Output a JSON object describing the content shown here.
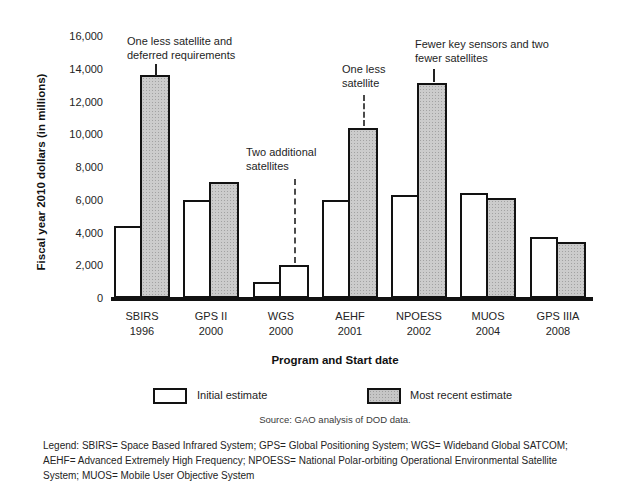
{
  "chart_data": {
    "type": "bar",
    "title": "",
    "ylabel": "Fiscal year 2010 dollars (in millions)",
    "xlabel": "Program and Start date",
    "ylim": [
      0,
      16000
    ],
    "ytick_interval": 2000,
    "ytick_labels": [
      "16,000",
      "14,000",
      "12,000",
      "10,000",
      "8,000",
      "6,000",
      "4,000",
      "2,000",
      "0"
    ],
    "grid": "off",
    "legend_position": "bottom",
    "categories": [
      {
        "program": "SBIRS",
        "start_date": "1996"
      },
      {
        "program": "GPS II",
        "start_date": "2000"
      },
      {
        "program": "WGS",
        "start_date": "2000"
      },
      {
        "program": "AEHF",
        "start_date": "2001"
      },
      {
        "program": "NPOESS",
        "start_date": "2002"
      },
      {
        "program": "MUOS",
        "start_date": "2004"
      },
      {
        "program": "GPS IIIA",
        "start_date": "2008"
      }
    ],
    "series": [
      {
        "name": "Initial estimate",
        "fill": "white",
        "values": [
          4400,
          6000,
          1000,
          6000,
          6300,
          6400,
          3700
        ]
      },
      {
        "name": "Most recent estimate",
        "fill": "gray-halftone",
        "fill_exceptions": [
          2
        ],
        "values": [
          13600,
          7100,
          2000,
          10400,
          13100,
          6100,
          3400
        ]
      }
    ],
    "annotations": [
      {
        "lines": [
          "One less satellite and",
          "deferred requirements"
        ],
        "target_category": "SBIRS",
        "leader": "solid"
      },
      {
        "lines": [
          "Two additional",
          "satellites"
        ],
        "target_category": "WGS",
        "leader": "dashed"
      },
      {
        "lines": [
          "One less",
          "satellite"
        ],
        "target_category": "AEHF",
        "leader": "dashed"
      },
      {
        "lines": [
          "Fewer key sensors and two",
          "fewer satellites"
        ],
        "target_category": "NPOESS",
        "leader": "solid"
      }
    ],
    "source": "Source: GAO analysis of DOD data.",
    "abbreviation_legend_lines": [
      "Legend: SBIRS= Space Based Infrared System; GPS= Global Positioning System; WGS= Wideband Global SATCOM;",
      "AEHF= Advanced Extremely High Frequency; NPOESS= National Polar-orbiting Operational Environmental Satellite",
      "System; MUOS= Mobile User Objective System"
    ],
    "colors": {
      "bar_border": "#121212",
      "gray_fill": "#cccccc",
      "white_fill": "#ffffff",
      "text": "#1c1c1c"
    }
  }
}
